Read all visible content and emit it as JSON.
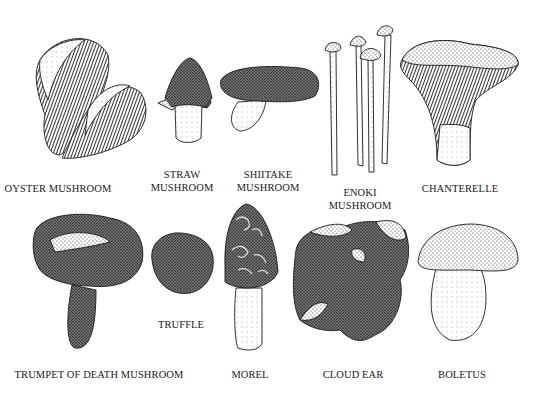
{
  "illustration": {
    "style": "black-and-white stippled pen illustration",
    "ink_color": "#1a1a1a",
    "background": "#ffffff"
  },
  "mushrooms": [
    {
      "id": "oyster",
      "label_lines": [
        "OYSTER MUSHROOM"
      ],
      "cx": 58,
      "y": 182
    },
    {
      "id": "straw",
      "label_lines": [
        "STRAW",
        "MUSHROOM"
      ],
      "cx": 182,
      "y": 168
    },
    {
      "id": "shiitake",
      "label_lines": [
        "SHIITAKE",
        "MUSHROOM"
      ],
      "cx": 268,
      "y": 168
    },
    {
      "id": "enoki",
      "label_lines": [
        "ENOKI",
        "MUSHROOM"
      ],
      "cx": 360,
      "y": 186
    },
    {
      "id": "chanterelle",
      "label_lines": [
        "CHANTERELLE"
      ],
      "cx": 460,
      "y": 182
    },
    {
      "id": "trumpet-of-death",
      "label_lines": [
        "TRUMPET OF DEATH MUSHROOM"
      ],
      "cx": 99,
      "y": 368
    },
    {
      "id": "truffle",
      "label_lines": [
        "TRUFFLE"
      ],
      "cx": 181,
      "y": 318
    },
    {
      "id": "morel",
      "label_lines": [
        "MOREL"
      ],
      "cx": 250,
      "y": 368
    },
    {
      "id": "cloud-ear",
      "label_lines": [
        "CLOUD EAR"
      ],
      "cx": 353,
      "y": 368
    },
    {
      "id": "boletus",
      "label_lines": [
        "BOLETUS"
      ],
      "cx": 462,
      "y": 368
    }
  ]
}
